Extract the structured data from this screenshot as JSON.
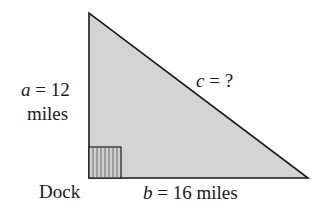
{
  "diagram": {
    "type": "right-triangle",
    "fill_color": "#d4d4d4",
    "stroke_color": "#1a1a1a",
    "labels": {
      "a_var": "a",
      "a_value": " = 12",
      "a_unit": "miles",
      "b_var": "b",
      "b_value": " = 16 miles",
      "c_var": "c",
      "c_value": " = ?",
      "vertex": "Dock"
    }
  }
}
